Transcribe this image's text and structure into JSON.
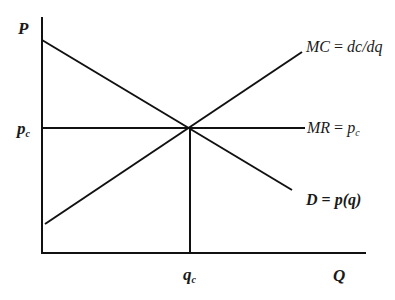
{
  "diagram": {
    "type": "economics-supply-demand",
    "axes": {
      "y_label": "P",
      "x_label": "Q"
    },
    "tick_labels": {
      "price": {
        "base": "p",
        "sub": "c"
      },
      "quantity": {
        "base": "q",
        "sub": "c"
      }
    },
    "curves": {
      "marginal_cost": {
        "label_lhs": "MC",
        "label_rhs": "dc/dq",
        "equals": "="
      },
      "marginal_revenue": {
        "label_lhs": "MR",
        "label_rhs_base": "p",
        "label_rhs_sub": "c",
        "equals": "="
      },
      "demand": {
        "label_lhs": "D",
        "label_rhs": "p(q)",
        "equals": "="
      }
    },
    "colors": {
      "line": "#111111",
      "text": "#1a1a1a",
      "background": "#ffffff"
    }
  }
}
